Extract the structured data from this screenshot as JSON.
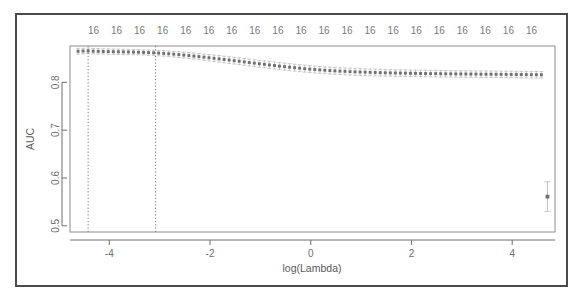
{
  "figure": {
    "kind": "cv-glmnet-auc-plot",
    "background_color": "#ffffff",
    "frame_color": "#4a4a4a",
    "point_color": "#707070",
    "errorbar_color": "#b4b4b4",
    "vline_color": "#555555"
  },
  "axes": {
    "x_title": "log(Lambda)",
    "y_title": "AUC",
    "x_ticks": [
      "-4",
      "-2",
      "0",
      "2",
      "4"
    ],
    "x_tick_values": [
      -4,
      -2,
      0,
      2,
      4
    ],
    "y_ticks": [
      "0.5",
      "0.6",
      "0.7",
      "0.8"
    ],
    "y_tick_values": [
      0.5,
      0.6,
      0.7,
      0.8
    ],
    "x_range": [
      -4.78,
      4.85
    ],
    "y_range": [
      0.487,
      0.876
    ],
    "top_axis_label_text": "16",
    "top_axis_labels": [
      "16",
      "16",
      "16",
      "16",
      "16",
      "16",
      "16",
      "16",
      "16",
      "16",
      "16",
      "16",
      "16",
      "16",
      "16",
      "16",
      "16",
      "16",
      "16",
      "16"
    ]
  },
  "chart_data": {
    "type": "scatter",
    "title": "",
    "subtitle": "",
    "xlabel": "log(Lambda)",
    "ylabel": "AUC",
    "xlim": [
      -4.78,
      4.85
    ],
    "ylim": [
      0.487,
      0.876
    ],
    "grid": false,
    "legend": null,
    "top_axis_label": "Number of nonzero coefficients",
    "top_axis_values": [
      16,
      16,
      16,
      16,
      16,
      16,
      16,
      16,
      16,
      16,
      16,
      16,
      16,
      16,
      16,
      16,
      16,
      16,
      16,
      16
    ],
    "annotations": [
      {
        "name": "lambda-min-line",
        "type": "vline",
        "x": -4.42,
        "style": "dotted"
      },
      {
        "name": "lambda-1se-line",
        "type": "vline",
        "x": -3.08,
        "style": "dotted"
      }
    ],
    "series": [
      {
        "name": "AUC mean with 1-SE error bars",
        "marker": "point",
        "errorbar": true,
        "x": [
          -4.62,
          -4.52,
          -4.42,
          -4.32,
          -4.22,
          -4.12,
          -4.02,
          -3.92,
          -3.82,
          -3.72,
          -3.62,
          -3.52,
          -3.42,
          -3.32,
          -3.22,
          -3.12,
          -3.02,
          -2.92,
          -2.82,
          -2.72,
          -2.62,
          -2.52,
          -2.42,
          -2.32,
          -2.22,
          -2.12,
          -2.02,
          -1.92,
          -1.82,
          -1.72,
          -1.62,
          -1.52,
          -1.42,
          -1.32,
          -1.22,
          -1.12,
          -1.02,
          -0.92,
          -0.82,
          -0.72,
          -0.62,
          -0.52,
          -0.42,
          -0.32,
          -0.22,
          -0.12,
          -0.02,
          0.08,
          0.18,
          0.28,
          0.38,
          0.48,
          0.58,
          0.68,
          0.78,
          0.88,
          0.98,
          1.08,
          1.18,
          1.28,
          1.38,
          1.48,
          1.58,
          1.68,
          1.78,
          1.88,
          1.98,
          2.08,
          2.18,
          2.28,
          2.38,
          2.48,
          2.58,
          2.68,
          2.78,
          2.88,
          2.98,
          3.08,
          3.18,
          3.28,
          3.38,
          3.48,
          3.58,
          3.68,
          3.78,
          3.88,
          3.98,
          4.08,
          4.18,
          4.28,
          4.38,
          4.48,
          4.58,
          4.7
        ],
        "y": [
          0.865,
          0.8655,
          0.8658,
          0.8652,
          0.8648,
          0.8646,
          0.8644,
          0.8641,
          0.8639,
          0.8637,
          0.8635,
          0.8633,
          0.863,
          0.8626,
          0.8622,
          0.8618,
          0.8612,
          0.8605,
          0.8597,
          0.8589,
          0.858,
          0.857,
          0.856,
          0.8549,
          0.8538,
          0.8527,
          0.8515,
          0.8503,
          0.8491,
          0.8478,
          0.8466,
          0.8453,
          0.8441,
          0.8428,
          0.8415,
          0.8402,
          0.8389,
          0.8377,
          0.8364,
          0.8352,
          0.834,
          0.8328,
          0.8317,
          0.8306,
          0.8296,
          0.8286,
          0.8277,
          0.8268,
          0.826,
          0.8253,
          0.8246,
          0.824,
          0.8234,
          0.8229,
          0.8224,
          0.822,
          0.8216,
          0.8212,
          0.8209,
          0.8206,
          0.8203,
          0.82,
          0.8198,
          0.8196,
          0.8194,
          0.8192,
          0.819,
          0.8188,
          0.8186,
          0.8185,
          0.8183,
          0.8182,
          0.818,
          0.8179,
          0.8178,
          0.8176,
          0.8175,
          0.8174,
          0.8173,
          0.8172,
          0.8171,
          0.817,
          0.8169,
          0.8168,
          0.8167,
          0.8166,
          0.8165,
          0.8164,
          0.8163,
          0.8162,
          0.8161,
          0.816,
          0.8159,
          0.561
        ],
        "yerr": [
          0.006,
          0.0058,
          0.0058,
          0.0057,
          0.0057,
          0.0056,
          0.0056,
          0.0056,
          0.0055,
          0.0055,
          0.0055,
          0.0055,
          0.0055,
          0.0055,
          0.0056,
          0.0056,
          0.0057,
          0.0058,
          0.0059,
          0.006,
          0.0061,
          0.0062,
          0.0063,
          0.0064,
          0.0065,
          0.0066,
          0.0067,
          0.0068,
          0.0069,
          0.0069,
          0.007,
          0.007,
          0.0071,
          0.0071,
          0.0072,
          0.0072,
          0.0072,
          0.0073,
          0.0073,
          0.0073,
          0.0073,
          0.0073,
          0.0073,
          0.0073,
          0.0073,
          0.0073,
          0.0073,
          0.0072,
          0.0072,
          0.0072,
          0.0072,
          0.0072,
          0.0071,
          0.0071,
          0.0071,
          0.0071,
          0.007,
          0.007,
          0.007,
          0.007,
          0.007,
          0.007,
          0.0069,
          0.0069,
          0.0069,
          0.0069,
          0.0069,
          0.0069,
          0.0069,
          0.0069,
          0.0068,
          0.0068,
          0.0068,
          0.0068,
          0.0068,
          0.0068,
          0.0068,
          0.0068,
          0.0068,
          0.0068,
          0.0068,
          0.0068,
          0.0068,
          0.0068,
          0.0068,
          0.0068,
          0.0068,
          0.0068,
          0.0068,
          0.0068,
          0.0068,
          0.0068,
          0.0068,
          0.031
        ]
      }
    ]
  }
}
